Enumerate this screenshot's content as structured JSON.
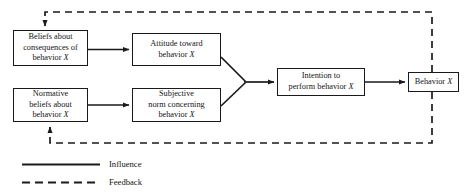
{
  "diagram": {
    "colors": {
      "line": "#1a1a1a",
      "text": "#141414",
      "background": "#ffffff"
    },
    "nodes": [
      {
        "id": "beliefs-about-consequences",
        "line1": "Beliefs about",
        "line2": "consequences of",
        "line3": "behavior",
        "variable": "X"
      },
      {
        "id": "normative-beliefs",
        "line1": "Normative",
        "line2": "beliefs about",
        "line3": "behavior",
        "variable": "X"
      },
      {
        "id": "attitude-toward-behavior",
        "line1": "Attitude toward",
        "line2": "behavior",
        "variable": "X"
      },
      {
        "id": "subjective-norm",
        "line1": "Subjective",
        "line2": "norm concerning",
        "line3": "behavior",
        "variable": "X"
      },
      {
        "id": "intention-to-perform",
        "line1": "Intention to",
        "line2": "perform behavior",
        "variable": "X"
      },
      {
        "id": "behavior",
        "line1": "Behavior",
        "variable": "X"
      }
    ],
    "legend": [
      {
        "id": "influence",
        "label": "Influence",
        "style": "solid"
      },
      {
        "id": "feedback",
        "label": "Feedback",
        "style": "dashed"
      }
    ]
  }
}
